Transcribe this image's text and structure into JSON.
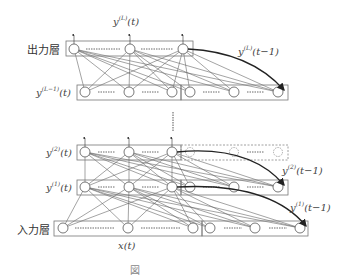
{
  "diagram": {
    "type": "recurrent-neural-network (Jordan/Elman-style multilayer)",
    "colors": {
      "line": "#555555",
      "thick_arrow": "#222222",
      "box": "#777777",
      "text": "#444444"
    },
    "layers": [
      {
        "id": "output",
        "label": "出力層",
        "symbol": "y",
        "superscript": "(L)",
        "arg": "(t)"
      },
      {
        "id": "layer_L_minus_1",
        "label_symbol": "y",
        "superscript": "(L-1)",
        "arg": "(t)"
      },
      {
        "id": "layer_2",
        "label_symbol": "y",
        "superscript": "(2)",
        "arg": "(t)"
      },
      {
        "id": "layer_1",
        "label_symbol": "y",
        "superscript": "(1)",
        "arg": "(t)"
      },
      {
        "id": "input",
        "label": "入力層"
      }
    ],
    "labels": {
      "output_layer": "出力層",
      "input_layer": "入力層",
      "yL_t_base": "y",
      "yL_t_sup": "(L)",
      "yL_t_arg": "(t)",
      "yL_tm1_base": "y",
      "yL_tm1_sup": "(L)",
      "yL_tm1_arg": "(t−1)",
      "yLm1_t_base": "y",
      "yLm1_t_sup": "(L−1)",
      "yLm1_t_arg": "(t)",
      "y2_t_base": "y",
      "y2_t_sup": "(2)",
      "y2_t_arg": "(t)",
      "y2_tm1_base": "y",
      "y2_tm1_sup": "(2)",
      "y2_tm1_arg": "(t−1)",
      "y1_t_base": "y",
      "y1_t_sup": "(1)",
      "y1_t_arg": "(t)",
      "y1_tm1_base": "y",
      "y1_tm1_sup": "(1)",
      "y1_tm1_arg": "(t−1)",
      "x_t": "x(t)"
    },
    "caption": "図"
  }
}
